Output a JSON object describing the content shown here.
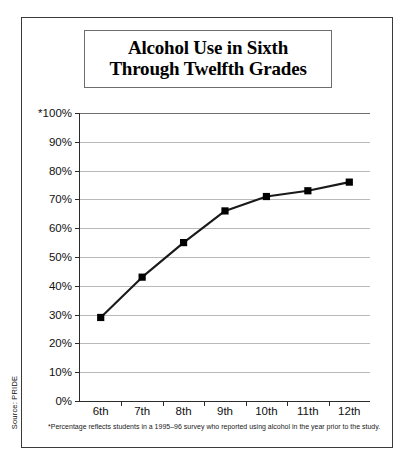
{
  "figure": {
    "title_line1": "Alcohol Use in Sixth",
    "title_line2": "Through Twelfth Grades",
    "source": "Source: PRIDE",
    "footnote": "*Percentage reflects students in a 1995–96 survey who reported using alcohol in the year prior to the study."
  },
  "chart_data": {
    "type": "line",
    "title": "Alcohol Use in Sixth Through Twelfth Grades",
    "xlabel": "",
    "ylabel": "",
    "categories": [
      "6th",
      "7th",
      "8th",
      "9th",
      "10th",
      "11th",
      "12th"
    ],
    "values": [
      29,
      43,
      55,
      66,
      71,
      73,
      76
    ],
    "ylim": [
      0,
      100
    ],
    "yticks": [
      0,
      10,
      20,
      30,
      40,
      50,
      60,
      70,
      80,
      90,
      100
    ],
    "ytick_labels": [
      "0%",
      "10%",
      "20%",
      "30%",
      "40%",
      "50%",
      "60%",
      "70%",
      "80%",
      "90%",
      "*100%"
    ],
    "grid": true,
    "legend": "none",
    "marker": "square",
    "line_color": "#1a1a1a",
    "marker_color": "#000000",
    "grid_color": "#b9b9b9",
    "annotations": [
      "*Percentage reflects students in a 1995–96 survey who reported using alcohol in the year prior to the study."
    ]
  }
}
